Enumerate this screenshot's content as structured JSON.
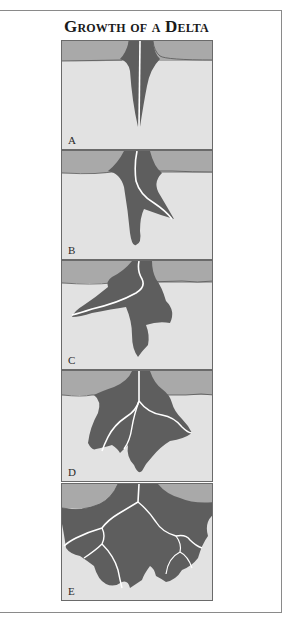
{
  "figure": {
    "title": "Growth of a Delta",
    "colors": {
      "water": "#a9a9a9",
      "ocean": "#e2e2e2",
      "delta": "#5e5e5e",
      "channel": "#ffffff",
      "border": "#6a6a6a"
    },
    "panels": [
      {
        "label": "A",
        "stage": "Initial channel extends into basin"
      },
      {
        "label": "B",
        "stage": "Channel bends; sediment lobe forms"
      },
      {
        "label": "C",
        "stage": "Lobe widens to one side"
      },
      {
        "label": "D",
        "stage": "Distributary channels branch"
      },
      {
        "label": "E",
        "stage": "Fully developed branching delta"
      }
    ]
  }
}
